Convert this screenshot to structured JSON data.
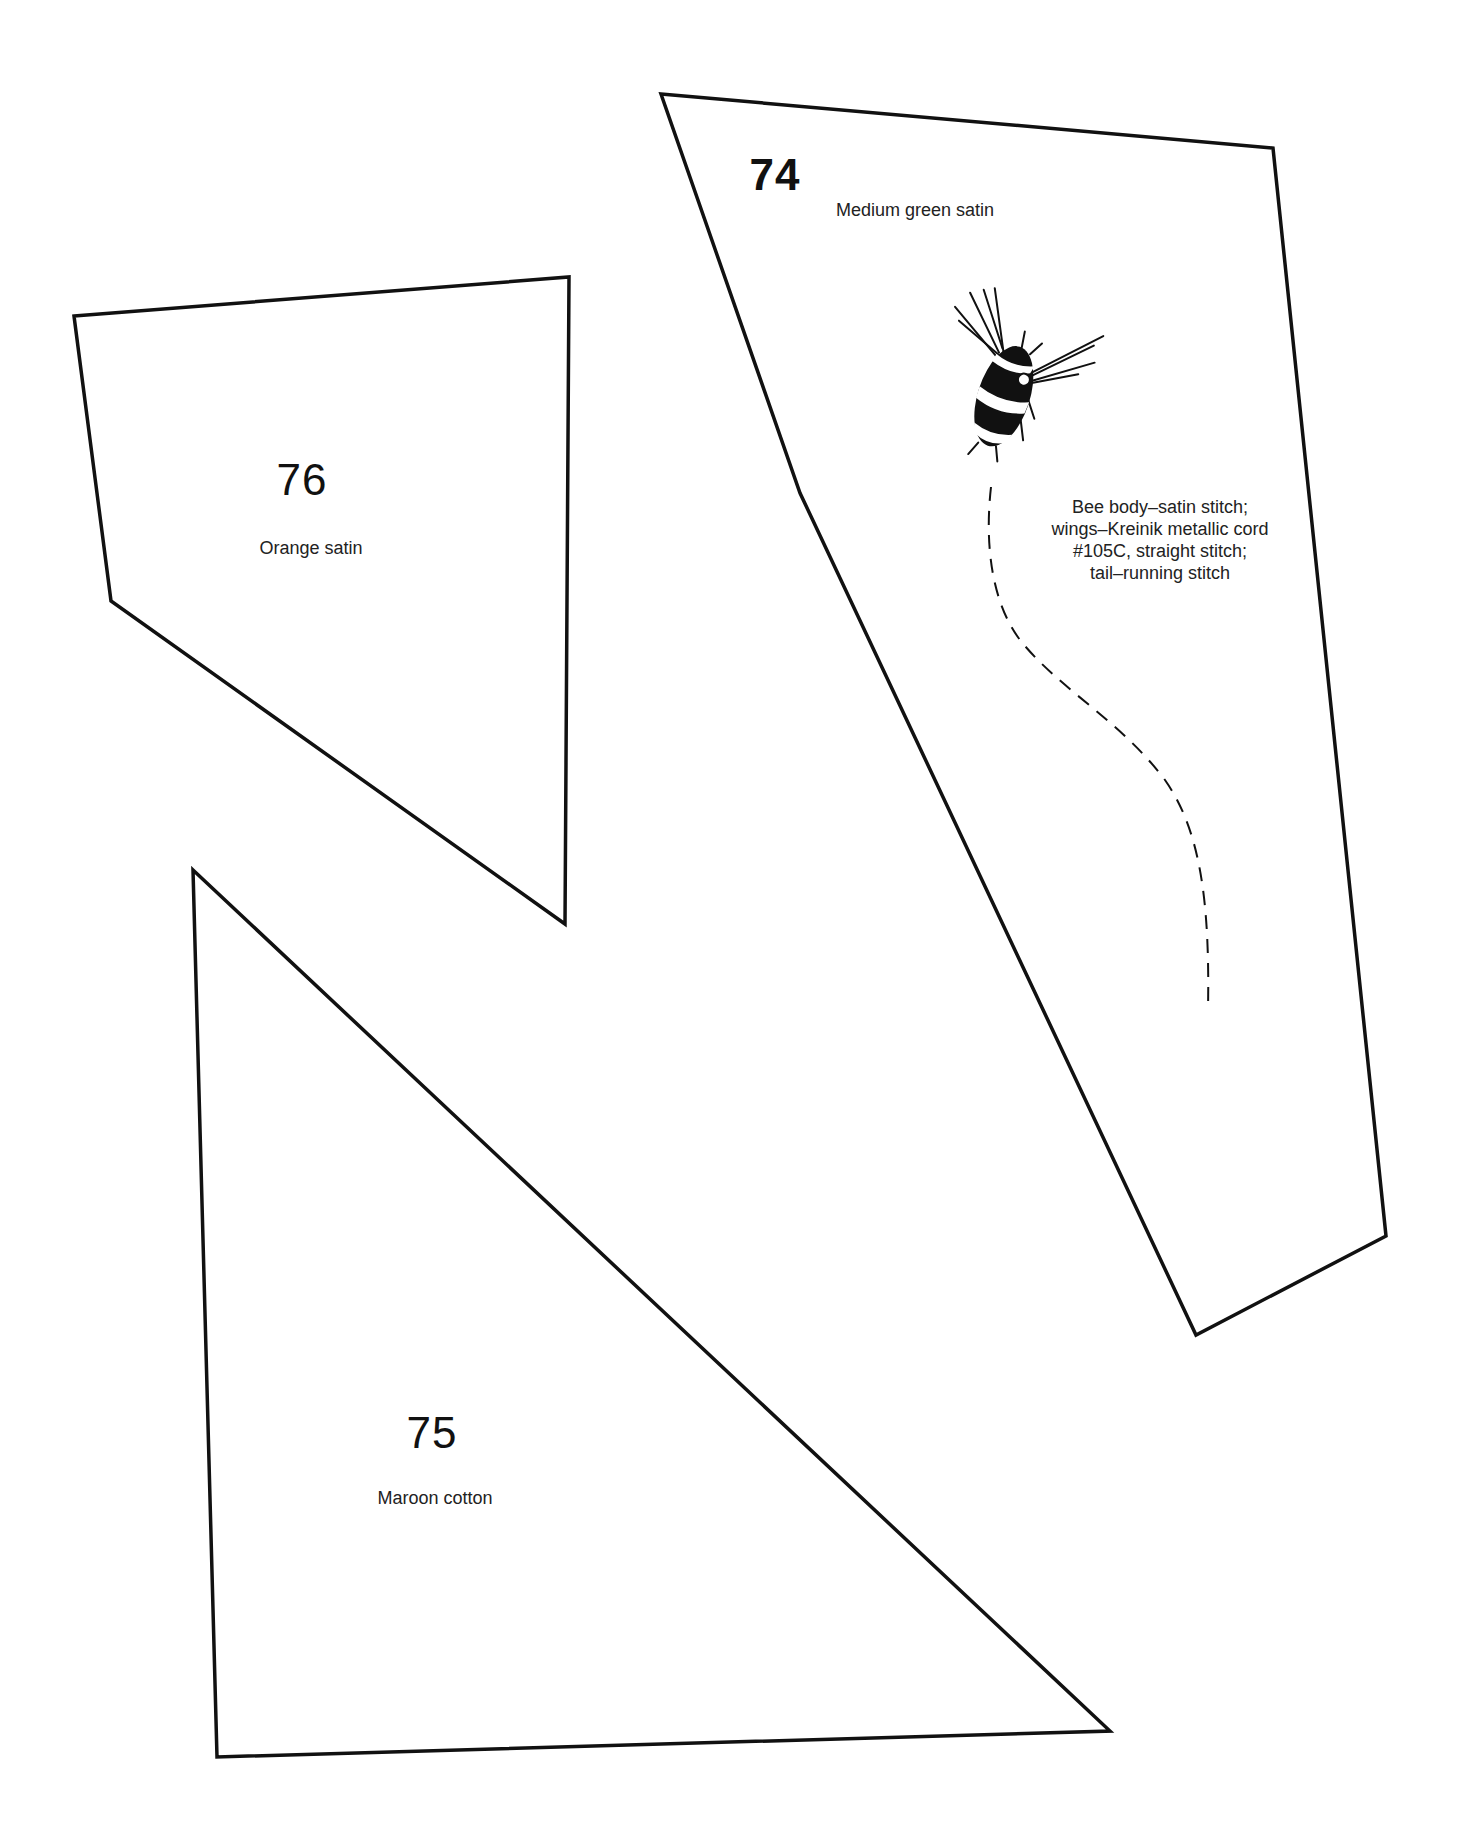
{
  "page": {
    "background": "#ffffff",
    "line_color": "#111111"
  },
  "pieces": [
    {
      "number": "74",
      "label": "Medium green satin",
      "polygon": [
        [
          661,
          94
        ],
        [
          1273,
          148
        ],
        [
          1386,
          1236
        ],
        [
          1196,
          1335
        ],
        [
          800,
          493
        ]
      ],
      "number_pos": [
        775,
        177
      ],
      "label_pos": [
        915,
        215
      ]
    },
    {
      "number": "76",
      "label": "Orange satin",
      "polygon": [
        [
          74,
          316
        ],
        [
          569,
          277
        ],
        [
          565,
          924
        ],
        [
          111,
          601
        ]
      ],
      "number_pos": [
        302,
        484
      ],
      "label_pos": [
        311,
        553
      ]
    },
    {
      "number": "75",
      "label": "Maroon cotton",
      "polygon": [
        [
          193,
          870
        ],
        [
          1110,
          1731
        ],
        [
          217,
          1757
        ]
      ],
      "number_pos": [
        432,
        1439
      ],
      "label_pos": [
        435,
        1503
      ]
    }
  ],
  "bee_note": {
    "lines": [
      "Bee body–satin stitch;",
      "wings–Kreinik metallic cord",
      "#105C, straight stitch;",
      "tail–running stitch"
    ],
    "pos": [
      1160,
      500
    ]
  },
  "bee_tail_path": "M991,487 C985,540 990,600 1020,640 C1060,690 1120,720 1165,780 C1200,830 1210,900 1208,1010"
}
